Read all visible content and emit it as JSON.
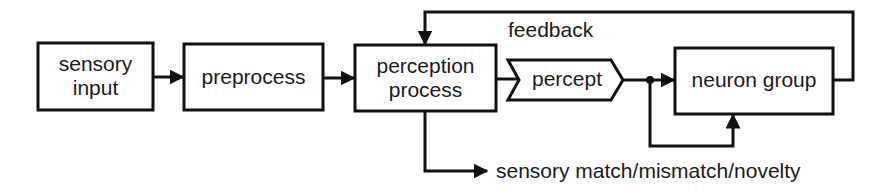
{
  "diagram": {
    "nodes": [
      {
        "id": "sensory-input",
        "label_line1": "sensory",
        "label_line2": "input"
      },
      {
        "id": "preprocess",
        "label": "preprocess"
      },
      {
        "id": "perception-process",
        "label_line1": "perception",
        "label_line2": "process"
      },
      {
        "id": "percept",
        "label": "percept",
        "shape": "chevron"
      },
      {
        "id": "neuron-group",
        "label": "neuron group"
      }
    ],
    "edges": [
      {
        "from": "sensory-input",
        "to": "preprocess"
      },
      {
        "from": "preprocess",
        "to": "perception-process"
      },
      {
        "from": "perception-process",
        "to": "percept"
      },
      {
        "from": "percept",
        "to": "neuron-group"
      },
      {
        "from": "percept",
        "to": "neuron-group",
        "via": "bottom loop"
      },
      {
        "from": "neuron-group",
        "to": "perception-process",
        "label": "feedback"
      },
      {
        "from": "perception-process",
        "to": "output",
        "label": "sensory match/mismatch/novelty"
      }
    ],
    "labels": {
      "feedback": "feedback",
      "output": "sensory match/mismatch/novelty"
    },
    "colors": {
      "stroke": "#111111",
      "text": "#1a1a1a",
      "background": "#ffffff"
    }
  }
}
